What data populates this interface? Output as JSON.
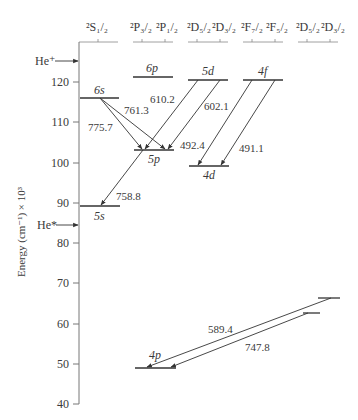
{
  "figure": {
    "y_axis_label": "Energy (cm⁻¹) × 10³",
    "y_ticks": [
      40,
      50,
      60,
      70,
      80,
      90,
      100,
      110,
      120
    ],
    "column_headers": [
      {
        "id": "S",
        "terms": [
          "²S₁/₂"
        ]
      },
      {
        "id": "P",
        "terms": [
          "²P₃/₂",
          "²P₁/₂"
        ]
      },
      {
        "id": "D",
        "terms": [
          "²D₅/₂",
          "²D₃/₂"
        ]
      },
      {
        "id": "F",
        "terms": [
          "²F₇/₂",
          "²F₅/₂"
        ]
      },
      {
        "id": "D2",
        "terms": [
          "²D₅/₂",
          "²D₃/₂"
        ]
      }
    ],
    "markers": [
      {
        "label": "He⁺",
        "energy": 124.5
      },
      {
        "label": "He*",
        "energy": 84.5
      }
    ],
    "levels": [
      {
        "label": "6s",
        "energy": 116
      },
      {
        "label": "6p",
        "energy": 121
      },
      {
        "label": "5d",
        "energy": 120.5
      },
      {
        "label": "4f",
        "energy": 120.5
      },
      {
        "label": "5p",
        "energy": 103
      },
      {
        "label": "4d",
        "energy": 99
      },
      {
        "label": "5s",
        "energy": 89
      },
      {
        "label": "4p",
        "energy": 48.5
      },
      {
        "label": "",
        "energy": 66
      },
      {
        "label": "",
        "energy": 62.5
      }
    ],
    "transitions": [
      {
        "label": "775.7",
        "from": "6s",
        "to": "5p"
      },
      {
        "label": "761.3",
        "from": "6s",
        "to": "5p"
      },
      {
        "label": "610.2",
        "from": "5d",
        "to": "5p"
      },
      {
        "label": "602.1",
        "from": "5d",
        "to": "5p"
      },
      {
        "label": "492.4",
        "from": "4f",
        "to": "4d"
      },
      {
        "label": "491.1",
        "from": "4f",
        "to": "4d"
      },
      {
        "label": "758.8",
        "from": "5p",
        "to": "5s"
      },
      {
        "label": "589.4",
        "from": "upper-D",
        "to": "4p"
      },
      {
        "label": "747.8",
        "from": "lower-D",
        "to": "4p"
      }
    ]
  }
}
